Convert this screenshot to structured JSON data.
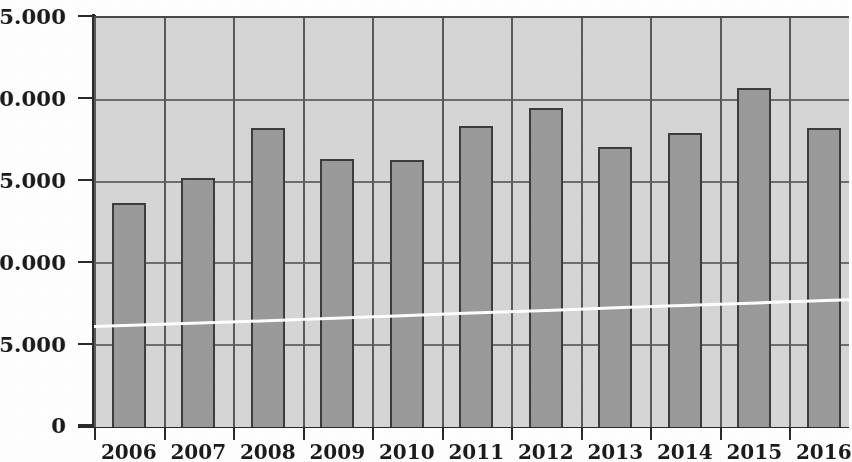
{
  "chart_data": {
    "type": "bar",
    "title": "",
    "subtitle": "",
    "xlabel": "",
    "ylabel": "",
    "categories": [
      "2006",
      "2007",
      "2008",
      "2009",
      "2010",
      "2011",
      "2012",
      "2013",
      "2014",
      "2015",
      "2016"
    ],
    "values": [
      13700,
      15200,
      18300,
      16400,
      16300,
      18400,
      19500,
      17100,
      18000,
      20700,
      18300
    ],
    "series": [
      {
        "name": "bars",
        "type": "bar",
        "values": [
          13700,
          15200,
          18300,
          16400,
          16300,
          18400,
          19500,
          17100,
          18000,
          20700,
          18300
        ]
      },
      {
        "name": "trend-line",
        "type": "line",
        "values": [
          6150,
          6300,
          6450,
          6620,
          6790,
          6960,
          7130,
          7300,
          7460,
          7620,
          7780
        ]
      }
    ],
    "ylim": [
      0,
      25000
    ],
    "yticks": [
      0,
      5000,
      10000,
      15000,
      20000,
      25000
    ],
    "ytick_labels": [
      "0",
      "5.000",
      "10.000",
      "15.000",
      "20.000",
      "25.000"
    ],
    "grid": true,
    "grid_axis": "both",
    "legend": "none",
    "colors": {
      "bar_fill": "#9b9b9b",
      "bar_edge": "#3d3d3d",
      "plot_background": "#d6d6d6",
      "gridline": "#6e6e6e",
      "axis": "#2b2b2b",
      "trend_line": "#ffffff",
      "text": "#1c1c1c",
      "page_background": "#ffffff"
    }
  },
  "axes": {
    "y_tick_labels": [
      "25.000",
      "20.000",
      "15.000",
      "10.000",
      "5.000",
      "0"
    ],
    "x_tick_labels": [
      "2006",
      "2007",
      "2008",
      "2009",
      "2010",
      "2011",
      "2012",
      "2013",
      "2014",
      "2015",
      "2016"
    ]
  }
}
